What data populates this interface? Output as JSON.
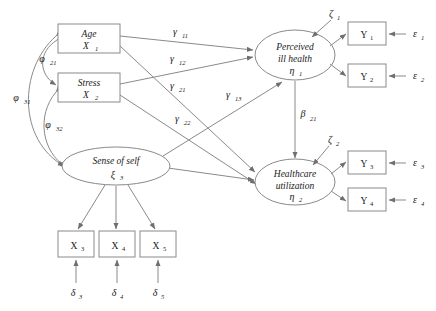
{
  "figure": {
    "type": "structural-equation-model-path-diagram",
    "background": "#ffffff",
    "line_color": "#8a8a8a",
    "text_color": "#1a1a1a"
  },
  "exogenous_observed": [
    {
      "id": "age",
      "name": "Age",
      "symbol": "X",
      "sub": "1"
    },
    {
      "id": "stress",
      "name": "Stress",
      "symbol": "X",
      "sub": "2"
    }
  ],
  "exogenous_latent": [
    {
      "id": "sense",
      "name": "Sense of self",
      "symbol": "ξ",
      "sub": "3"
    }
  ],
  "endogenous_latent": [
    {
      "id": "eta1",
      "line1": "Perceived",
      "line2": "ill health",
      "symbol": "η",
      "sub": "1"
    },
    {
      "id": "eta2",
      "line1": "Healthcare",
      "line2": "utilization",
      "symbol": "η",
      "sub": "2"
    }
  ],
  "indicators_x": [
    {
      "id": "x3",
      "symbol": "X",
      "sub": "3"
    },
    {
      "id": "x4",
      "symbol": "X",
      "sub": "4"
    },
    {
      "id": "x5",
      "symbol": "X",
      "sub": "5"
    }
  ],
  "indicators_y": [
    {
      "id": "y1",
      "symbol": "Y",
      "sub": "1"
    },
    {
      "id": "y2",
      "symbol": "Y",
      "sub": "2"
    },
    {
      "id": "y3",
      "symbol": "Y",
      "sub": "3"
    },
    {
      "id": "y4",
      "symbol": "Y",
      "sub": "4"
    }
  ],
  "errors_delta": [
    {
      "id": "d3",
      "symbol": "δ",
      "sub": "3"
    },
    {
      "id": "d4",
      "symbol": "δ",
      "sub": "4"
    },
    {
      "id": "d5",
      "symbol": "δ",
      "sub": "5"
    }
  ],
  "errors_epsilon": [
    {
      "id": "e1",
      "symbol": "ε",
      "sub": "1"
    },
    {
      "id": "e2",
      "symbol": "ε",
      "sub": "2"
    },
    {
      "id": "e3",
      "symbol": "ε",
      "sub": "3"
    },
    {
      "id": "e4",
      "symbol": "ε",
      "sub": "4"
    }
  ],
  "disturbances": [
    {
      "id": "z1",
      "symbol": "ζ",
      "sub": "1"
    },
    {
      "id": "z2",
      "symbol": "ζ",
      "sub": "2"
    }
  ],
  "covariances": [
    {
      "id": "phi21",
      "symbol": "φ",
      "sub": "21"
    },
    {
      "id": "phi31",
      "symbol": "φ",
      "sub": "31"
    },
    {
      "id": "phi32",
      "symbol": "φ",
      "sub": "32"
    }
  ],
  "structural_paths": [
    {
      "id": "g11",
      "symbol": "γ",
      "sub": "11"
    },
    {
      "id": "g12",
      "symbol": "γ",
      "sub": "12"
    },
    {
      "id": "g21",
      "symbol": "γ",
      "sub": "21"
    },
    {
      "id": "g13",
      "symbol": "γ",
      "sub": "13"
    },
    {
      "id": "g22",
      "symbol": "γ",
      "sub": "22"
    },
    {
      "id": "b21",
      "symbol": "β",
      "sub": "21"
    }
  ]
}
